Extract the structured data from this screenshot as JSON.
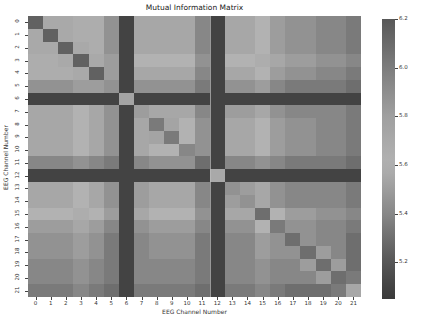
{
  "chart_data": {
    "type": "heatmap",
    "title": "Mutual Information Matrix",
    "xlabel": "EEG Channel Number",
    "ylabel": "EEG Channel Number",
    "x_tick_labels": [
      "0",
      "1",
      "2",
      "3",
      "4",
      "5",
      "6",
      "7",
      "8",
      "9",
      "10",
      "11",
      "12",
      "13",
      "14",
      "15",
      "16",
      "17",
      "18",
      "19",
      "20",
      "21"
    ],
    "y_tick_labels": [
      "0",
      "1",
      "2",
      "3",
      "4",
      "5",
      "6",
      "7",
      "8",
      "9",
      "10",
      "11",
      "12",
      "13",
      "14",
      "15",
      "16",
      "17",
      "18",
      "19",
      "20",
      "21"
    ],
    "colorbar": {
      "min": 5.05,
      "max": 6.2,
      "ticks": [
        "6.2",
        "6.0",
        "5.8",
        "5.6",
        "5.4",
        "5.2"
      ],
      "tick_values": [
        6.2,
        6.0,
        5.8,
        5.6,
        5.4,
        5.2
      ]
    },
    "matrix": [
      [
        6.15,
        5.7,
        5.7,
        5.65,
        5.65,
        5.45,
        5.1,
        5.55,
        5.55,
        5.55,
        5.55,
        5.4,
        5.1,
        5.55,
        5.55,
        5.6,
        5.5,
        5.45,
        5.45,
        5.4,
        5.4,
        5.35
      ],
      [
        5.7,
        6.15,
        5.7,
        5.65,
        5.65,
        5.45,
        5.1,
        5.55,
        5.55,
        5.55,
        5.55,
        5.4,
        5.1,
        5.55,
        5.55,
        5.6,
        5.5,
        5.45,
        5.45,
        5.4,
        5.4,
        5.35
      ],
      [
        5.7,
        5.7,
        6.15,
        5.7,
        5.65,
        5.45,
        5.1,
        5.55,
        5.55,
        5.55,
        5.55,
        5.4,
        5.1,
        5.55,
        5.55,
        5.6,
        5.5,
        5.45,
        5.45,
        5.4,
        5.4,
        5.35
      ],
      [
        5.65,
        5.65,
        5.7,
        6.15,
        5.7,
        5.5,
        5.1,
        5.6,
        5.6,
        5.6,
        5.6,
        5.45,
        5.1,
        5.6,
        5.6,
        5.65,
        5.55,
        5.5,
        5.5,
        5.45,
        5.45,
        5.4
      ],
      [
        5.65,
        5.65,
        5.65,
        5.7,
        6.15,
        5.5,
        5.1,
        5.55,
        5.55,
        5.55,
        5.55,
        5.4,
        5.1,
        5.55,
        5.55,
        5.6,
        5.5,
        5.45,
        5.45,
        5.4,
        5.4,
        5.35
      ],
      [
        5.45,
        5.45,
        5.45,
        5.5,
        5.5,
        5.45,
        5.1,
        5.45,
        5.45,
        5.45,
        5.45,
        5.35,
        5.1,
        5.45,
        5.45,
        5.5,
        5.4,
        5.35,
        5.35,
        5.35,
        5.35,
        5.3
      ],
      [
        5.1,
        5.1,
        5.1,
        5.1,
        5.1,
        5.1,
        5.75,
        5.1,
        5.1,
        5.1,
        5.1,
        5.1,
        5.1,
        5.1,
        5.1,
        5.1,
        5.1,
        5.1,
        5.1,
        5.1,
        5.1,
        5.1
      ],
      [
        5.55,
        5.55,
        5.55,
        5.6,
        5.55,
        5.45,
        5.1,
        5.5,
        5.55,
        5.55,
        5.55,
        5.4,
        5.1,
        5.5,
        5.5,
        5.55,
        5.45,
        5.4,
        5.4,
        5.4,
        5.4,
        5.35
      ],
      [
        5.55,
        5.55,
        5.55,
        5.6,
        5.55,
        5.45,
        5.1,
        5.55,
        5.35,
        5.75,
        5.6,
        5.45,
        5.1,
        5.55,
        5.55,
        5.6,
        5.5,
        5.45,
        5.45,
        5.4,
        5.4,
        5.35
      ],
      [
        5.55,
        5.55,
        5.55,
        5.6,
        5.55,
        5.45,
        5.1,
        5.55,
        5.75,
        5.35,
        5.6,
        5.45,
        5.1,
        5.55,
        5.55,
        5.6,
        5.5,
        5.45,
        5.45,
        5.4,
        5.4,
        5.35
      ],
      [
        5.55,
        5.55,
        5.55,
        5.6,
        5.55,
        5.45,
        5.1,
        5.55,
        5.6,
        5.6,
        5.4,
        5.45,
        5.1,
        5.55,
        5.55,
        5.6,
        5.5,
        5.45,
        5.45,
        5.4,
        5.4,
        5.35
      ],
      [
        5.4,
        5.4,
        5.4,
        5.45,
        5.4,
        5.35,
        5.1,
        5.4,
        5.45,
        5.45,
        5.45,
        5.3,
        5.1,
        5.4,
        5.4,
        5.45,
        5.4,
        5.35,
        5.35,
        5.35,
        5.35,
        5.3
      ],
      [
        5.1,
        5.1,
        5.1,
        5.1,
        5.1,
        5.1,
        5.1,
        5.1,
        5.1,
        5.1,
        5.1,
        5.1,
        5.7,
        5.1,
        5.1,
        5.1,
        5.1,
        5.1,
        5.1,
        5.1,
        5.1,
        5.1
      ],
      [
        5.55,
        5.55,
        5.55,
        5.6,
        5.55,
        5.45,
        5.1,
        5.5,
        5.55,
        5.55,
        5.55,
        5.4,
        5.1,
        5.45,
        5.5,
        5.55,
        5.45,
        5.4,
        5.4,
        5.4,
        5.4,
        5.35
      ],
      [
        5.55,
        5.55,
        5.55,
        5.6,
        5.55,
        5.45,
        5.1,
        5.5,
        5.55,
        5.55,
        5.55,
        5.4,
        5.1,
        5.5,
        5.45,
        5.55,
        5.45,
        5.4,
        5.4,
        5.4,
        5.4,
        5.35
      ],
      [
        5.6,
        5.6,
        5.6,
        5.65,
        5.6,
        5.5,
        5.1,
        5.55,
        5.6,
        5.6,
        5.6,
        5.45,
        5.1,
        5.55,
        5.55,
        5.3,
        5.6,
        5.5,
        5.5,
        5.45,
        5.45,
        5.4
      ],
      [
        5.5,
        5.5,
        5.5,
        5.55,
        5.5,
        5.4,
        5.1,
        5.45,
        5.5,
        5.5,
        5.5,
        5.4,
        5.1,
        5.45,
        5.45,
        5.6,
        5.35,
        5.45,
        5.45,
        5.4,
        5.4,
        5.35
      ],
      [
        5.45,
        5.45,
        5.45,
        5.5,
        5.45,
        5.35,
        5.1,
        5.4,
        5.45,
        5.45,
        5.45,
        5.35,
        5.1,
        5.4,
        5.4,
        5.5,
        5.45,
        5.3,
        5.45,
        5.4,
        5.4,
        5.3
      ],
      [
        5.45,
        5.45,
        5.45,
        5.5,
        5.45,
        5.35,
        5.1,
        5.4,
        5.45,
        5.45,
        5.45,
        5.35,
        5.1,
        5.4,
        5.4,
        5.5,
        5.45,
        5.45,
        5.3,
        5.5,
        5.4,
        5.3
      ],
      [
        5.4,
        5.4,
        5.4,
        5.45,
        5.4,
        5.35,
        5.1,
        5.4,
        5.4,
        5.4,
        5.4,
        5.35,
        5.1,
        5.4,
        5.4,
        5.45,
        5.4,
        5.4,
        5.5,
        5.3,
        5.5,
        5.3
      ],
      [
        5.4,
        5.4,
        5.4,
        5.45,
        5.4,
        5.35,
        5.1,
        5.4,
        5.4,
        5.4,
        5.4,
        5.35,
        5.1,
        5.4,
        5.4,
        5.45,
        5.4,
        5.4,
        5.4,
        5.5,
        5.3,
        5.35
      ],
      [
        5.35,
        5.35,
        5.35,
        5.4,
        5.35,
        5.3,
        5.1,
        5.35,
        5.35,
        5.35,
        5.35,
        5.3,
        5.1,
        5.35,
        5.35,
        5.4,
        5.35,
        5.3,
        5.3,
        5.3,
        5.35,
        5.55
      ]
    ],
    "colormap_gray_stops": [
      {
        "v": 5.05,
        "g": 58
      },
      {
        "v": 5.2,
        "g": 85
      },
      {
        "v": 5.4,
        "g": 135
      },
      {
        "v": 5.6,
        "g": 178
      },
      {
        "v": 5.8,
        "g": 160
      },
      {
        "v": 6.0,
        "g": 125
      },
      {
        "v": 6.2,
        "g": 88
      }
    ],
    "grid": false,
    "legend_position": "colorbar-right"
  }
}
